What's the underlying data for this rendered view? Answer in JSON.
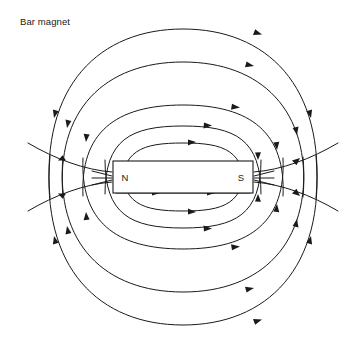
{
  "figure": {
    "caption": "Bar magnet",
    "width": 363,
    "height": 352,
    "background_color": "#ffffff",
    "line_color": "#1a1a1a"
  },
  "magnet": {
    "north_label": "N",
    "south_label": "S",
    "fill_color": "#ffffff",
    "stroke_color": "#1a1a1a",
    "x": 113,
    "y": 161,
    "width": 140,
    "height": 32,
    "center_x": 183,
    "center_y": 177
  },
  "diagram_data": {
    "type": "field-line-diagram",
    "title": "Bar magnet",
    "field_direction": "from north pole (left) outward, looping around to south pole (right)",
    "arrow_count_visible": 30,
    "loop_families": [
      {
        "region": "above-magnet",
        "count": 5,
        "description": "nested closed loops arcing over the magnet, arrows pointing rightward along the top"
      },
      {
        "region": "below-magnet",
        "count": 5,
        "description": "nested closed loops arcing under the magnet, arrows pointing rightward along the bottom"
      },
      {
        "region": "escaping-left",
        "count": 2,
        "description": "open lines leaving the north pole to the left image edge"
      },
      {
        "region": "escaping-right",
        "count": 2,
        "description": "open lines entering the south pole from the right image edge"
      }
    ],
    "upper_loops": [
      {
        "index": 1,
        "top_y": 143,
        "half_width": 62
      },
      {
        "index": 2,
        "top_y": 126,
        "half_width": 78
      },
      {
        "index": 3,
        "top_y": 105,
        "half_width": 100
      },
      {
        "index": 4,
        "top_y": 62,
        "half_width": 120
      },
      {
        "index": 5,
        "top_y": 29,
        "half_width": 135
      }
    ],
    "lower_loops": [
      {
        "index": 1,
        "bottom_y": 211,
        "half_width": 62
      },
      {
        "index": 2,
        "bottom_y": 228,
        "half_width": 78
      },
      {
        "index": 3,
        "bottom_y": 249,
        "half_width": 100
      },
      {
        "index": 4,
        "bottom_y": 292,
        "half_width": 120
      },
      {
        "index": 5,
        "bottom_y": 325,
        "half_width": 135
      }
    ]
  }
}
